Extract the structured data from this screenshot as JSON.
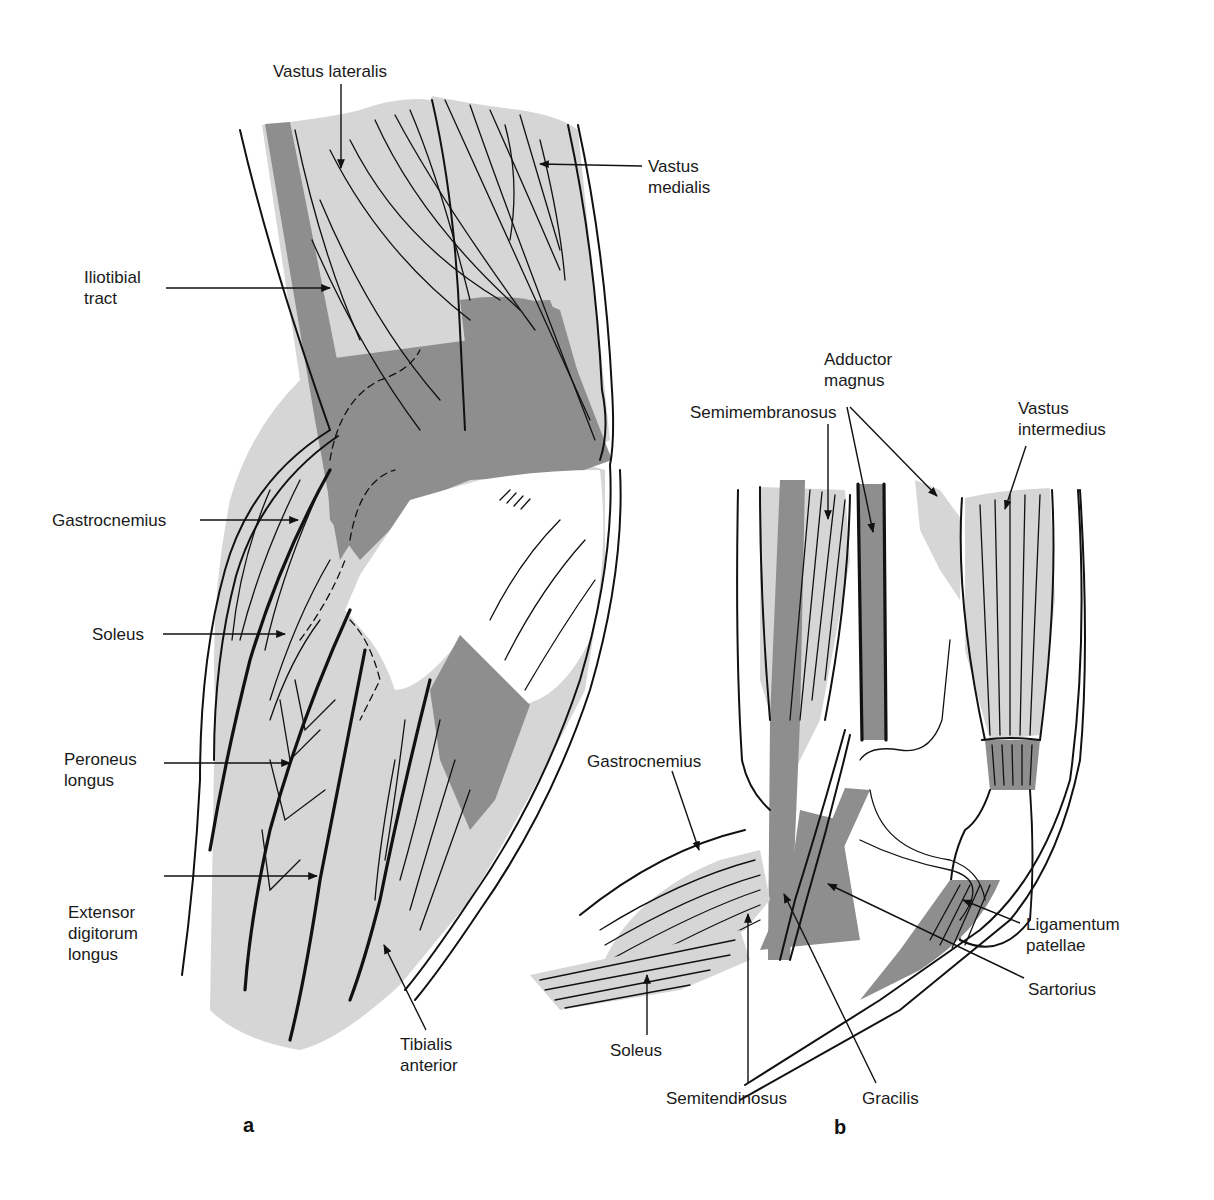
{
  "figure": {
    "panels": [
      {
        "id": "a",
        "panel_label": "a",
        "labels": {
          "vastus_lateralis": [
            "Vastus lateralis"
          ],
          "vastus_medialis": [
            "Vastus",
            "medialis"
          ],
          "iliotibial_tract": [
            "Iliotibial",
            "tract"
          ],
          "gastrocnemius": [
            "Gastrocnemius"
          ],
          "soleus": [
            "Soleus"
          ],
          "peroneus_longus": [
            "Peroneus",
            "longus"
          ],
          "extensor_digitorum_longus": [
            "Extensor",
            "digitorum",
            "longus"
          ],
          "tibialis_anterior": [
            "Tibialis",
            "anterior"
          ]
        }
      },
      {
        "id": "b",
        "panel_label": "b",
        "labels": {
          "adductor_magnus": [
            "Adductor",
            "magnus"
          ],
          "semimembranosus": [
            "Semimembranosus"
          ],
          "vastus_intermedius": [
            "Vastus",
            "intermedius"
          ],
          "gastrocnemius": [
            "Gastrocnemius"
          ],
          "ligamentum_patellae": [
            "Ligamentum",
            "patellae"
          ],
          "sartorius": [
            "Sartorius"
          ],
          "soleus": [
            "Soleus"
          ],
          "semitendinosus": [
            "Semitendinosus"
          ],
          "gracilis": [
            "Gracilis"
          ]
        }
      }
    ],
    "colors": {
      "muscle_light": "#d6d6d6",
      "muscle_dark": "#8e8e8e",
      "outline": "#111111",
      "background": "#ffffff"
    }
  }
}
